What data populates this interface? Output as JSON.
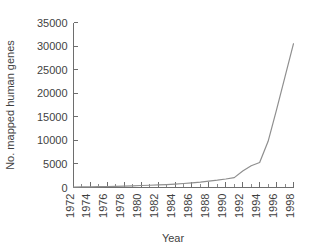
{
  "chart_data": {
    "type": "line",
    "title": "",
    "xlabel": "Year",
    "ylabel": "No. mapped human genes",
    "xlim": [
      1972,
      1998
    ],
    "ylim": [
      0,
      35000
    ],
    "grid": false,
    "legend": null,
    "x_tick_labels": [
      "1972",
      "1974",
      "1976",
      "1978",
      "1980",
      "1982",
      "1984",
      "1986",
      "1988",
      "1990",
      "1992",
      "1994",
      "1996",
      "1998"
    ],
    "x_tick_values": [
      1972,
      1974,
      1976,
      1978,
      1980,
      1982,
      1984,
      1986,
      1988,
      1990,
      1992,
      1994,
      1996,
      1998
    ],
    "x_minor_tick_values": [
      1973,
      1975,
      1977,
      1979,
      1981,
      1983,
      1985,
      1987,
      1989,
      1991,
      1993,
      1995,
      1997
    ],
    "y_tick_labels": [
      "0",
      "5000",
      "10000",
      "15000",
      "20000",
      "25000",
      "30000",
      "35000"
    ],
    "y_tick_values": [
      0,
      5000,
      10000,
      15000,
      20000,
      25000,
      30000,
      35000
    ],
    "x": [
      1972,
      1973,
      1974,
      1975,
      1976,
      1977,
      1978,
      1979,
      1980,
      1981,
      1982,
      1983,
      1984,
      1985,
      1986,
      1987,
      1988,
      1989,
      1990,
      1991,
      1992,
      1993,
      1994,
      1995,
      1996,
      1997,
      1998
    ],
    "values": [
      100,
      120,
      150,
      180,
      210,
      250,
      300,
      350,
      420,
      480,
      550,
      620,
      720,
      850,
      1000,
      1150,
      1350,
      1550,
      1800,
      2100,
      3500,
      4600,
      5300,
      9800,
      16500,
      23500,
      30500
    ],
    "series": [
      {
        "name": "No. mapped human genes",
        "color": "#8f8f8f",
        "values": [
          100,
          120,
          150,
          180,
          210,
          250,
          300,
          350,
          420,
          480,
          550,
          620,
          720,
          850,
          1000,
          1150,
          1350,
          1550,
          1800,
          2100,
          3500,
          4600,
          5300,
          9800,
          16500,
          23500,
          30500
        ]
      }
    ]
  },
  "style": {
    "background": "#ffffff",
    "axis_color": "#6e6e6e",
    "text_color": "#3f3f3f",
    "line_color": "#8f8f8f"
  }
}
